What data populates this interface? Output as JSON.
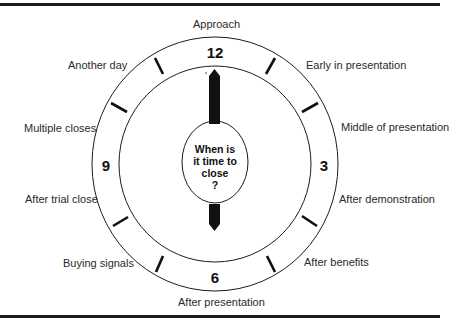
{
  "diagram": {
    "type": "clock",
    "center_question": [
      "When is",
      "it time to",
      "close",
      "?"
    ],
    "numbers": {
      "twelve": "12",
      "three": "3",
      "six": "6",
      "nine": "9"
    },
    "labels": {
      "approach": "Approach",
      "early_in_presentation": "Early in presentation",
      "middle_of_presentation": "Middle of presentation",
      "after_demonstration": "After demonstration",
      "after_benefits": "After benefits",
      "after_presentation": "After presentation",
      "buying_signals": "Buying signals",
      "after_trial_close": "After trial close",
      "multiple_closes": "Multiple closes",
      "another_day": "Another day"
    },
    "colors": {
      "line": "#1c1c1c",
      "hand": "#111111",
      "background": "#ffffff"
    }
  }
}
